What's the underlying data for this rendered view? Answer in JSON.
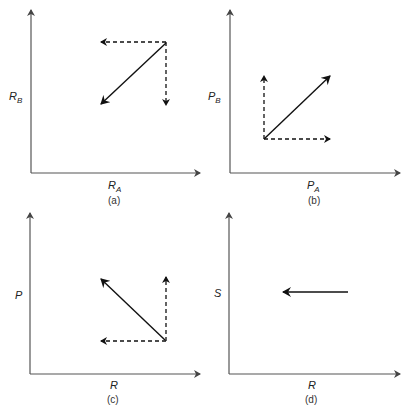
{
  "panels": [
    {
      "id": "a",
      "caption": "(a)",
      "y_label": {
        "main": "R",
        "sub": "B"
      },
      "x_label": {
        "main": "R",
        "sub": "A"
      },
      "vectors": [
        {
          "style": "dashed",
          "direction": "left",
          "desc": "decrease along x-axis"
        },
        {
          "style": "dashed",
          "direction": "down",
          "desc": "decrease along y-axis"
        },
        {
          "style": "solid",
          "direction": "down-left",
          "desc": "resultant"
        }
      ]
    },
    {
      "id": "b",
      "caption": "(b)",
      "y_label": {
        "main": "P",
        "sub": "B"
      },
      "x_label": {
        "main": "P",
        "sub": "A"
      },
      "vectors": [
        {
          "style": "dashed",
          "direction": "up",
          "desc": "increase along y-axis"
        },
        {
          "style": "dashed",
          "direction": "right",
          "desc": "increase along x-axis"
        },
        {
          "style": "solid",
          "direction": "up-right",
          "desc": "resultant"
        }
      ]
    },
    {
      "id": "c",
      "caption": "(c)",
      "y_label": {
        "main": "P",
        "sub": ""
      },
      "x_label": {
        "main": "R",
        "sub": ""
      },
      "vectors": [
        {
          "style": "dashed",
          "direction": "up",
          "desc": "increase along y-axis"
        },
        {
          "style": "dashed",
          "direction": "left",
          "desc": "decrease along x-axis"
        },
        {
          "style": "solid",
          "direction": "up-left",
          "desc": "resultant"
        }
      ]
    },
    {
      "id": "d",
      "caption": "(d)",
      "y_label": {
        "main": "S",
        "sub": ""
      },
      "x_label": {
        "main": "R",
        "sub": ""
      },
      "vectors": [
        {
          "style": "solid",
          "direction": "left",
          "desc": "decrease along x-axis"
        }
      ]
    }
  ],
  "colors": {
    "axis": "#555555",
    "vector": "#111111"
  }
}
